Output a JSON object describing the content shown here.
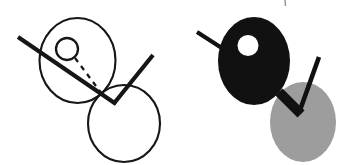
{
  "canvas": {
    "width": 346,
    "height": 165,
    "background_color": "#ffffff",
    "title": "paired abstract figures: outline version and filled version"
  },
  "palette": {
    "ink": "#161616",
    "black_fill": "#111111",
    "gray_fill": "#9d9d9d",
    "white_fill": "#ffffff",
    "background": "#ffffff"
  },
  "strokes": {
    "circle_outline_width": 2.1,
    "bar_width": 4.2,
    "dash_width": 2.2,
    "dash_pattern": "5 5",
    "tick_width": 1.6
  },
  "figures": [
    {
      "id": "left-figure",
      "label": "outline figure",
      "style": "outline",
      "parts": {
        "upper_circle": {
          "cx": 77.5,
          "cy": 60.5,
          "rx": 38.0,
          "ry": 42.5
        },
        "lower_circle": {
          "cx": 124.0,
          "cy": 123.5,
          "rx": 36.0,
          "ry": 38.5
        },
        "small_circle": {
          "cx": 67.0,
          "cy": 49.0,
          "rx": 11.0,
          "ry": 11.0
        },
        "long_bar": {
          "x1": 18.0,
          "y1": 37.0,
          "x2": 116.0,
          "y2": 104.0
        },
        "right_bar": {
          "x1": 153.0,
          "y1": 55.0,
          "x2": 113.5,
          "y2": 104.0
        },
        "dashed_line": {
          "x1": 75.0,
          "y1": 58.0,
          "x2": 102.0,
          "y2": 94.0
        }
      }
    },
    {
      "id": "right-figure",
      "label": "filled figure",
      "style": "filled",
      "parts": {
        "black_blob": {
          "cx": 254.0,
          "cy": 61.0,
          "rx": 36.0,
          "ry": 44.0
        },
        "gray_circle": {
          "cx": 303.0,
          "cy": 122.0,
          "rx": 33.0,
          "ry": 40.0
        },
        "white_hole": {
          "cx": 248.0,
          "cy": 45.5,
          "rx": 10.5,
          "ry": 10.5
        },
        "left_bar": {
          "x1": 197.0,
          "y1": 32.0,
          "x2": 228.0,
          "y2": 52.0
        },
        "right_bar": {
          "x1": 319.0,
          "y1": 57.0,
          "x2": 299.0,
          "y2": 113.0
        },
        "neck_bar": {
          "x1": 279.0,
          "y1": 92.0,
          "x2": 301.0,
          "y2": 114.0
        }
      }
    }
  ],
  "marks": [
    {
      "id": "corner-tick",
      "label": "registration tick mark",
      "x1": 285.0,
      "y1": 0.0,
      "x2": 285.5,
      "y2": 6.0
    }
  ]
}
